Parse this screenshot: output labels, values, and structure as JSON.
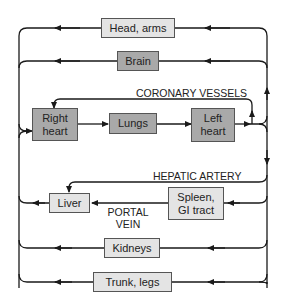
{
  "diagram": {
    "colors": {
      "light_box": "#e4e4e4",
      "dark_box": "#a9a9a9",
      "line": "#1a1a1a"
    },
    "nodes": {
      "head_arms": "Head, arms",
      "brain": "Brain",
      "right_heart": "Right heart",
      "lungs": "Lungs",
      "left_heart": "Left heart",
      "liver": "Liver",
      "spleen_gi": "Spleen, GI tract",
      "kidneys": "Kidneys",
      "trunk_legs": "Trunk, legs"
    },
    "node_lines": {
      "right_heart": [
        "Right",
        "heart"
      ],
      "left_heart": [
        "Left",
        "heart"
      ],
      "spleen_gi": [
        "Spleen,",
        "GI tract"
      ]
    },
    "labels": {
      "coronary": "CORONARY VESSELS",
      "hepatic": "HEPATIC ARTERY",
      "portal_1": "PORTAL",
      "portal_2": "VEIN"
    },
    "edges": [
      [
        "right_heart",
        "lungs"
      ],
      [
        "lungs",
        "left_heart"
      ],
      [
        "left_heart",
        "head_arms"
      ],
      [
        "left_heart",
        "brain"
      ],
      [
        "left_heart",
        "right_heart",
        "coronary"
      ],
      [
        "left_heart",
        "liver",
        "hepatic"
      ],
      [
        "left_heart",
        "spleen_gi"
      ],
      [
        "spleen_gi",
        "liver",
        "portal vein"
      ],
      [
        "left_heart",
        "kidneys"
      ],
      [
        "left_heart",
        "trunk_legs"
      ],
      [
        "head_arms",
        "right_heart"
      ],
      [
        "brain",
        "right_heart"
      ],
      [
        "liver",
        "right_heart"
      ],
      [
        "kidneys",
        "right_heart"
      ],
      [
        "trunk_legs",
        "right_heart"
      ]
    ]
  }
}
